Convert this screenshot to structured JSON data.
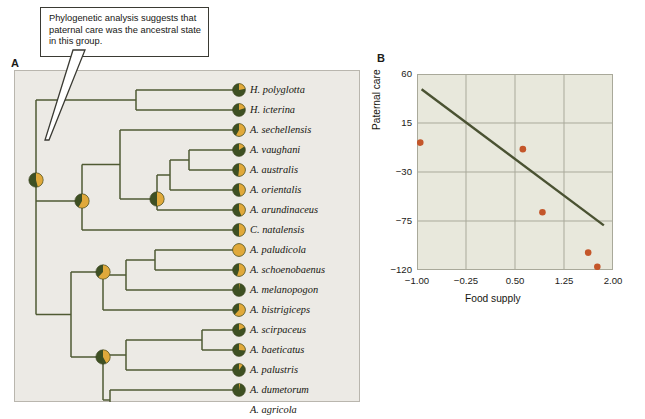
{
  "figure": {
    "panel_a_label": "A",
    "panel_b_label": "B",
    "callout_text": "Phylogenetic analysis suggests that paternal care was the ancestral state in this group."
  },
  "colors": {
    "dark_green": "#3e5023",
    "gold": "#e0a93b",
    "branch": "#4f5a33",
    "panel_bg": "#eceae5",
    "plot_bg": "#e8e8dc",
    "grid": "#a9a99a",
    "point": "#c4562a",
    "trendline": "#4a5232",
    "text": "#16160f"
  },
  "tree": {
    "tips": [
      {
        "name": "H. polyglotta",
        "gold_fraction": 0.22,
        "y": 20
      },
      {
        "name": "H. icterina",
        "gold_fraction": 0.2,
        "y": 40
      },
      {
        "name": "A. sechellensis",
        "gold_fraction": 0.58,
        "y": 60
      },
      {
        "name": "A. vaughani",
        "gold_fraction": 0.16,
        "y": 80
      },
      {
        "name": "A. australis",
        "gold_fraction": 0.52,
        "y": 100
      },
      {
        "name": "A. orientalis",
        "gold_fraction": 0.46,
        "y": 120
      },
      {
        "name": "A. arundinaceus",
        "gold_fraction": 0.44,
        "y": 140
      },
      {
        "name": "C. natalensis",
        "gold_fraction": 0.5,
        "y": 160
      },
      {
        "name": "A. paludicola",
        "gold_fraction": 1.0,
        "y": 180
      },
      {
        "name": "A. schoenobaenus",
        "gold_fraction": 0.55,
        "y": 200
      },
      {
        "name": "A. melanopogon",
        "gold_fraction": 0.02,
        "y": 220
      },
      {
        "name": "A. bistrigiceps",
        "gold_fraction": 0.62,
        "y": 240
      },
      {
        "name": "A. scirpaceus",
        "gold_fraction": 0.18,
        "y": 260
      },
      {
        "name": "A. baeticatus",
        "gold_fraction": 0.26,
        "y": 280
      },
      {
        "name": "A. palustris",
        "gold_fraction": 0.1,
        "y": 300
      },
      {
        "name": "A. dumetorum",
        "gold_fraction": 0.03,
        "y": 320
      },
      {
        "name": "A. agricola",
        "gold_fraction": 0.3,
        "y": 340
      }
    ],
    "nodes": [
      {
        "id": "root",
        "gold_fraction": 0.46,
        "x": 22,
        "y": 110
      },
      {
        "id": "nodeB",
        "gold_fraction": 0.58,
        "x": 68,
        "y": 131
      },
      {
        "id": "nodeC",
        "gold_fraction": 0.5,
        "x": 143,
        "y": 129
      },
      {
        "id": "nodeD",
        "gold_fraction": 0.62,
        "x": 89,
        "y": 202
      },
      {
        "id": "nodeE",
        "gold_fraction": 0.42,
        "x": 89,
        "y": 287
      }
    ]
  },
  "chart_data": {
    "type": "scatter",
    "title": "",
    "xlabel": "Food supply",
    "ylabel": "Paternal care",
    "xlim": [
      -1.0,
      2.0
    ],
    "ylim": [
      -120,
      60
    ],
    "xticks": [
      "-1.00",
      "-0.25",
      "0.50",
      "1.25",
      "2.00"
    ],
    "xtick_values": [
      -1.0,
      -0.25,
      0.5,
      1.25,
      2.0
    ],
    "yticks": [
      "60",
      "15",
      "-30",
      "-75",
      "-120"
    ],
    "ytick_values": [
      60,
      15,
      -30,
      -75,
      -120
    ],
    "grid": true,
    "legend": "none",
    "points": [
      {
        "x": -0.95,
        "y": -3
      },
      {
        "x": 0.62,
        "y": -9
      },
      {
        "x": 0.92,
        "y": -67
      },
      {
        "x": 1.62,
        "y": -104
      },
      {
        "x": 1.76,
        "y": -117
      }
    ],
    "trendline": {
      "x_start": -0.93,
      "y_start": 46,
      "x_end": 1.86,
      "y_end": -79
    }
  }
}
